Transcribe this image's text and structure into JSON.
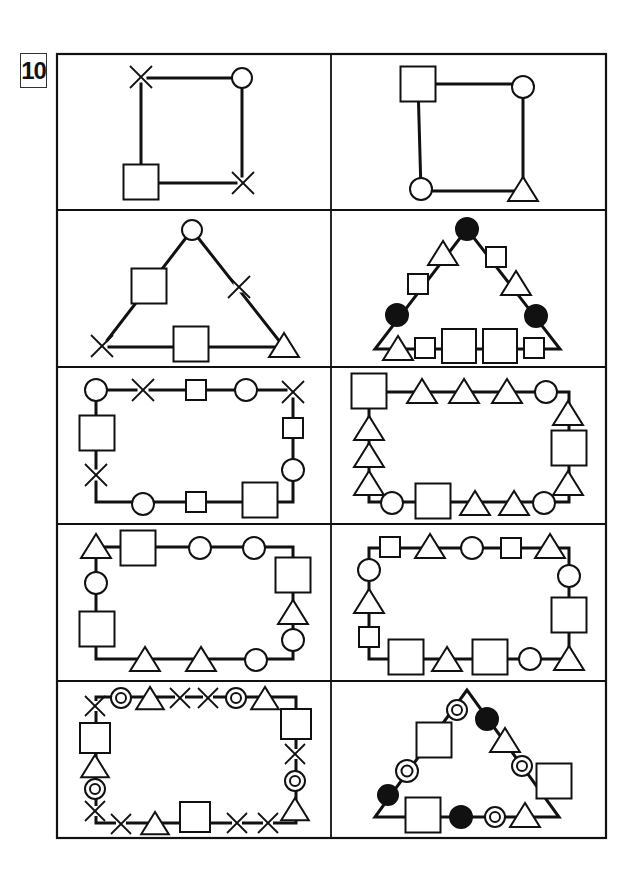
{
  "problem": {
    "number": "10"
  },
  "colors": {
    "ink": "#111111",
    "paper": "#ffffff"
  },
  "legend_symbols": [
    "square",
    "circle",
    "triangle",
    "cross",
    "filled-circle",
    "double-circle"
  ],
  "grid": {
    "rows": 5,
    "columns": 2
  },
  "cells": [
    {
      "id": "r1c1",
      "path_shape": "square",
      "symbols": [
        "cross",
        "circle",
        "cross",
        "square"
      ]
    },
    {
      "id": "r1c2",
      "path_shape": "square",
      "symbols": [
        "square",
        "circle",
        "triangle",
        "circle"
      ]
    },
    {
      "id": "r2c1",
      "path_shape": "triangle",
      "symbols": [
        "circle",
        "cross",
        "triangle",
        "square",
        "cross",
        "square"
      ]
    },
    {
      "id": "r2c2",
      "path_shape": "triangle",
      "symbols": [
        "filled-circle",
        "square",
        "triangle",
        "filled-circle",
        "square",
        "square",
        "square",
        "square",
        "triangle",
        "filled-circle",
        "square",
        "triangle"
      ]
    },
    {
      "id": "r3c1",
      "path_shape": "rectangle",
      "symbols": [
        "circle",
        "cross",
        "square",
        "circle",
        "cross",
        "square",
        "circle",
        "square",
        "square",
        "circle",
        "cross",
        "square"
      ]
    },
    {
      "id": "r3c2",
      "path_shape": "rectangle",
      "symbols": [
        "square",
        "triangle",
        "triangle",
        "triangle",
        "circle",
        "triangle",
        "square",
        "triangle",
        "circle",
        "triangle",
        "triangle",
        "square",
        "circle",
        "triangle",
        "triangle",
        "triangle"
      ]
    },
    {
      "id": "r4c1",
      "path_shape": "rectangle",
      "symbols": [
        "triangle",
        "square",
        "circle",
        "circle",
        "square",
        "triangle",
        "circle",
        "circle",
        "triangle",
        "triangle",
        "square",
        "circle"
      ]
    },
    {
      "id": "r4c2",
      "path_shape": "rectangle",
      "symbols": [
        "square",
        "triangle",
        "circle",
        "square",
        "triangle",
        "circle",
        "square",
        "triangle",
        "circle",
        "square",
        "triangle",
        "square",
        "square",
        "triangle",
        "circle"
      ]
    },
    {
      "id": "r5c1",
      "path_shape": "rectangle",
      "symbols": [
        "cross",
        "double-circle",
        "triangle",
        "cross",
        "cross",
        "double-circle",
        "triangle",
        "square",
        "cross",
        "double-circle",
        "triangle",
        "cross",
        "cross",
        "square",
        "triangle",
        "cross",
        "cross",
        "double-circle",
        "triangle",
        "square"
      ]
    },
    {
      "id": "r5c2",
      "path_shape": "triangle",
      "symbols": [
        "double-circle",
        "filled-circle",
        "triangle",
        "double-circle",
        "square",
        "triangle",
        "double-circle",
        "filled-circle",
        "square",
        "filled-circle",
        "double-circle",
        "square"
      ]
    }
  ]
}
